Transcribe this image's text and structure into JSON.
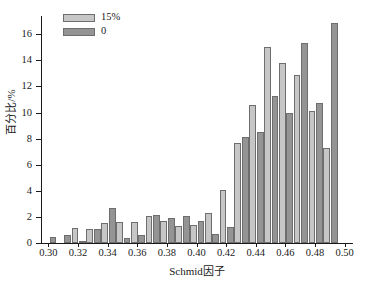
{
  "chart_data": {
    "type": "bar",
    "title": "",
    "xlabel": "Schmid因子",
    "ylabel": "百分比/%",
    "xlim": [
      0.295,
      0.505
    ],
    "ylim": [
      0,
      17.4
    ],
    "yticks": [
      0,
      2,
      4,
      6,
      8,
      10,
      12,
      14,
      16
    ],
    "ytick_labels": [
      "0",
      "2",
      "4",
      "6",
      "8",
      "10",
      "12",
      "14",
      "16"
    ],
    "xticks": [
      0.3,
      0.32,
      0.34,
      0.36,
      0.38,
      0.4,
      0.42,
      0.44,
      0.46,
      0.48,
      0.5
    ],
    "xtick_labels": [
      "0.30",
      "0.32",
      "0.34",
      "0.36",
      "0.38",
      "0.40",
      "0.42",
      "0.44",
      "0.46",
      "0.48",
      "0.50"
    ],
    "grid": false,
    "legend_position": "upper-left",
    "categories": [
      0.3,
      0.31,
      0.32,
      0.33,
      0.34,
      0.35,
      0.36,
      0.37,
      0.38,
      0.39,
      0.4,
      0.41,
      0.42,
      0.43,
      0.44,
      0.45,
      0.46,
      0.47,
      0.48,
      0.49
    ],
    "series": [
      {
        "name": "15%",
        "color": "#c6c6c6",
        "values": [
          0.0,
          0.0,
          1.15,
          1.05,
          1.5,
          1.6,
          1.6,
          2.05,
          1.65,
          1.3,
          1.4,
          2.3,
          4.1,
          7.7,
          10.55,
          15.0,
          13.8,
          12.85,
          10.15,
          7.3
        ]
      },
      {
        "name": "0",
        "color": "#949494",
        "values": [
          0.45,
          0.6,
          0.1,
          1.1,
          2.65,
          0.4,
          0.65,
          2.15,
          1.95,
          2.1,
          1.65,
          0.7,
          1.25,
          8.15,
          8.5,
          11.25,
          10.0,
          15.3,
          10.75,
          16.9
        ]
      }
    ]
  },
  "legend": {
    "items": [
      {
        "label": "15%",
        "color": "#c6c6c6"
      },
      {
        "label": "0",
        "color": "#949494"
      }
    ]
  }
}
